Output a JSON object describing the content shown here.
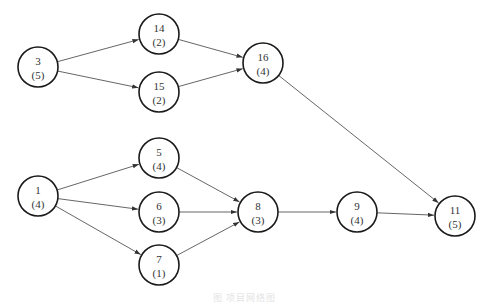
{
  "diagram": {
    "type": "activity-on-node network",
    "node_radius": 20,
    "nodes": [
      {
        "id": "3",
        "label": "3",
        "duration": "(5)",
        "x": 38,
        "y": 67
      },
      {
        "id": "14",
        "label": "14",
        "duration": "(2)",
        "x": 159,
        "y": 34
      },
      {
        "id": "15",
        "label": "15",
        "duration": "(2)",
        "x": 159,
        "y": 92
      },
      {
        "id": "16",
        "label": "16",
        "duration": "(4)",
        "x": 263,
        "y": 63
      },
      {
        "id": "1",
        "label": "1",
        "duration": "(4)",
        "x": 38,
        "y": 196
      },
      {
        "id": "5",
        "label": "5",
        "duration": "(4)",
        "x": 159,
        "y": 158
      },
      {
        "id": "6",
        "label": "6",
        "duration": "(3)",
        "x": 159,
        "y": 212
      },
      {
        "id": "7",
        "label": "7",
        "duration": "(1)",
        "x": 159,
        "y": 265
      },
      {
        "id": "8",
        "label": "8",
        "duration": "(3)",
        "x": 258,
        "y": 212
      },
      {
        "id": "9",
        "label": "9",
        "duration": "(4)",
        "x": 357,
        "y": 212
      },
      {
        "id": "11",
        "label": "11",
        "duration": "(5)",
        "x": 455,
        "y": 216
      }
    ],
    "edges": [
      {
        "from": "3",
        "to": "14"
      },
      {
        "from": "3",
        "to": "15"
      },
      {
        "from": "14",
        "to": "16"
      },
      {
        "from": "15",
        "to": "16"
      },
      {
        "from": "16",
        "to": "11"
      },
      {
        "from": "1",
        "to": "5"
      },
      {
        "from": "1",
        "to": "6"
      },
      {
        "from": "1",
        "to": "7"
      },
      {
        "from": "5",
        "to": "8"
      },
      {
        "from": "6",
        "to": "8"
      },
      {
        "from": "7",
        "to": "8"
      },
      {
        "from": "8",
        "to": "9"
      },
      {
        "from": "9",
        "to": "11"
      }
    ]
  },
  "caption": "图 项目网络图"
}
